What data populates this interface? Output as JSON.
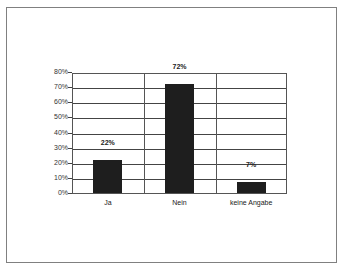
{
  "chart_data": {
    "type": "bar",
    "title": "",
    "categories": [
      "Ja",
      "Nein",
      "keine Angabe"
    ],
    "values": [
      22,
      72,
      7
    ],
    "data_labels": [
      "22%",
      "72%",
      "7%"
    ],
    "xlabel": "",
    "ylabel": "",
    "ylim": [
      0,
      80
    ],
    "yticks": [
      "0%",
      "10%",
      "20%",
      "30%",
      "40%",
      "50%",
      "60%",
      "70%",
      "80%"
    ],
    "grid": true,
    "legend": "none",
    "bar_color": "#1e1e1e"
  }
}
